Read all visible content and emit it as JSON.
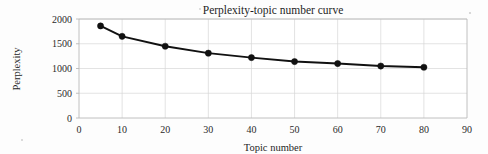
{
  "chart_data": {
    "type": "line",
    "title": "Perplexity-topic number curve",
    "xlabel": "Topic number",
    "ylabel": "Perplexity",
    "x": [
      5,
      10,
      20,
      30,
      40,
      50,
      60,
      70,
      80
    ],
    "values": [
      1860,
      1650,
      1450,
      1310,
      1220,
      1140,
      1100,
      1050,
      1025
    ],
    "series": [
      {
        "name": "Perplexity",
        "values": [
          1860,
          1650,
          1450,
          1310,
          1220,
          1140,
          1100,
          1050,
          1025
        ]
      }
    ],
    "xlim": [
      0,
      90
    ],
    "ylim": [
      0,
      2000
    ],
    "xticks": [
      0,
      10,
      20,
      30,
      40,
      50,
      60,
      70,
      80,
      90
    ],
    "yticks": [
      0,
      500,
      1000,
      1500,
      2000
    ],
    "xtick_labels": [
      "0",
      "10",
      "20",
      "30",
      "40",
      "50",
      "60",
      "70",
      "80",
      "90"
    ],
    "ytick_labels": [
      "0",
      "500",
      "1000",
      "1500",
      "2000"
    ],
    "grid": true,
    "legend": null,
    "legend_position": "none",
    "marker": "filled-circle",
    "line_color": "#111111",
    "marker_color": "#111111",
    "grid_color": "#d7d7d7",
    "background_color": "#ffffff"
  }
}
